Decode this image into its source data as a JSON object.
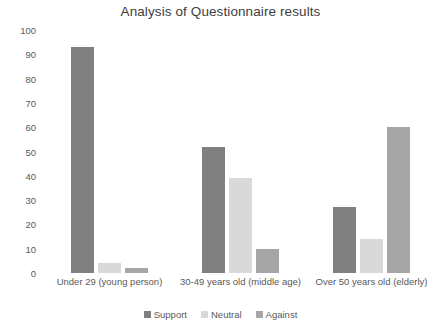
{
  "chart_data": {
    "type": "bar",
    "title": "Analysis of Questionnaire results",
    "xlabel": "",
    "ylabel": "",
    "categories": [
      "Under 29 (young person)",
      "30-49 years old (middle age)",
      "Over 50 years old (elderly)"
    ],
    "series": [
      {
        "name": "Support",
        "values": [
          93,
          52,
          27
        ],
        "color": "#808080"
      },
      {
        "name": "Neutral",
        "values": [
          4,
          39,
          14
        ],
        "color": "#D9D9D9"
      },
      {
        "name": "Against",
        "values": [
          2,
          10,
          60
        ],
        "color": "#A6A6A6"
      }
    ],
    "ylim": [
      0,
      100
    ],
    "yticks": [
      0,
      10,
      20,
      30,
      40,
      50,
      60,
      70,
      80,
      90,
      100
    ],
    "ytick_labels": [
      "0",
      "10",
      "20",
      "30",
      "40",
      "50",
      "60",
      "70",
      "80",
      "90",
      "100"
    ],
    "grid": false,
    "legend_position": "bottom",
    "background_color": "#FFFFFF",
    "text_color": "#595959"
  }
}
